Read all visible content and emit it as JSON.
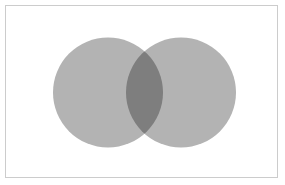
{
  "figure": {
    "type": "venn-diagram",
    "title": "",
    "width": 285,
    "height": 185,
    "background_color": "#ffffff"
  },
  "frame": {
    "border_color": "#cccccc",
    "border_width": 1,
    "x": 5,
    "y": 5,
    "width": 273,
    "height": 173,
    "fill": "#ffffff"
  },
  "chart_data": {
    "type": "venn",
    "title": "",
    "subtitle": "",
    "xlabel": "",
    "ylabel": "",
    "grid": false,
    "legend": "none",
    "sets": [
      {
        "name": "set-a",
        "label": "",
        "cx": 108,
        "cy": 92.5,
        "r": 55,
        "fill": "#b3b3b3",
        "opacity": 1
      },
      {
        "name": "set-b",
        "label": "",
        "cx": 181,
        "cy": 92.5,
        "r": 55,
        "fill": "#b3b3b3",
        "opacity": 1
      }
    ],
    "intersection": {
      "name": "set-a-and-set-b",
      "label": "",
      "fill": "#8b8b8b",
      "x_start": 126,
      "x_end": 163
    },
    "annotations": []
  }
}
